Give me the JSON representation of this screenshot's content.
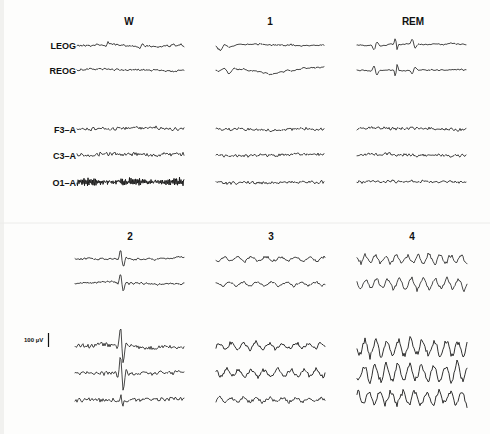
{
  "figure": {
    "channels_top": [
      "LEOG",
      "REOG",
      "F3–A",
      "C3–A",
      "O1–A"
    ],
    "scale_bar": {
      "label": "100 µV",
      "value_uv": 100
    },
    "top_row": {
      "stages": [
        {
          "title": "W",
          "note": "low-amplitude mixed EOG; dense alpha in O1-A"
        },
        {
          "title": "1",
          "note": "slow rolling eye movements; low-voltage mixed EEG"
        },
        {
          "title": "REM",
          "note": "rapid conjugate eye movements; low-voltage EEG"
        }
      ]
    },
    "bottom_row": {
      "stages": [
        {
          "title": "2",
          "note": "K-complex / spindle burst mid-epoch"
        },
        {
          "title": "3",
          "note": "moderate delta activity"
        },
        {
          "title": "4",
          "note": "high-amplitude delta activity"
        }
      ]
    }
  }
}
